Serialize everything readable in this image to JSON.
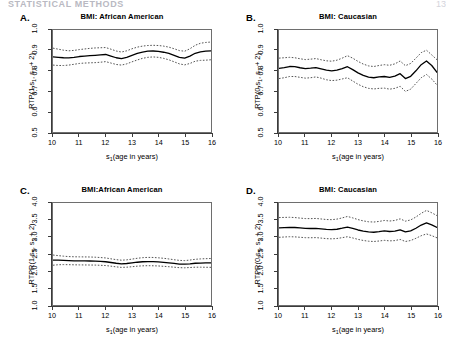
{
  "page": {
    "running_head": "STATISTICAL METHODS",
    "page_number": "13"
  },
  "figure": {
    "x_axis_title": "s1(age in years)",
    "x_ticks": [
      "10",
      "11",
      "12",
      "13",
      "14",
      "15",
      "16"
    ],
    "line_colors": {
      "estimate": "#000000",
      "confidence_band": "#555555",
      "axis": "#3b3b3b",
      "box": "#6e6e6e"
    }
  },
  "chart_data": [
    {
      "id": "A",
      "type": "line",
      "panel_letter": "A.",
      "title": "BMI: African American",
      "xlabel": "s1(age in years)",
      "ylabel": "RTP(1,s1, s1 + 2)",
      "ylabel_prefix": "RTP(1,s",
      "ylabel_suffix": ", s",
      "ylabel_tail": " + 2)",
      "xlim": [
        10,
        16
      ],
      "ylim": [
        0.5,
        1.0
      ],
      "y_ticks": [
        "0.5",
        "0.6",
        "0.7",
        "0.8",
        "0.9",
        "1.0"
      ],
      "grid": false,
      "legend": "none",
      "x": [
        10.0,
        10.2,
        10.4,
        10.6,
        10.8,
        11.0,
        11.2,
        11.4,
        11.6,
        11.8,
        12.0,
        12.2,
        12.4,
        12.6,
        12.8,
        13.0,
        13.2,
        13.4,
        13.6,
        13.8,
        14.0,
        14.2,
        14.4,
        14.6,
        14.8,
        15.0,
        15.2,
        15.4,
        15.6,
        15.8,
        16.0
      ],
      "series": [
        {
          "name": "estimate",
          "style": "solid",
          "values": [
            0.868,
            0.866,
            0.864,
            0.863,
            0.866,
            0.87,
            0.872,
            0.874,
            0.876,
            0.878,
            0.88,
            0.872,
            0.864,
            0.86,
            0.866,
            0.876,
            0.885,
            0.892,
            0.896,
            0.897,
            0.895,
            0.891,
            0.885,
            0.876,
            0.866,
            0.862,
            0.872,
            0.886,
            0.893,
            0.896,
            0.898
          ]
        },
        {
          "name": "upper confidence band",
          "style": "dotted",
          "values": [
            0.911,
            0.906,
            0.901,
            0.898,
            0.9,
            0.904,
            0.907,
            0.91,
            0.912,
            0.913,
            0.914,
            0.906,
            0.897,
            0.892,
            0.898,
            0.908,
            0.916,
            0.921,
            0.924,
            0.925,
            0.924,
            0.921,
            0.916,
            0.908,
            0.899,
            0.896,
            0.908,
            0.925,
            0.935,
            0.939,
            0.941
          ]
        },
        {
          "name": "lower confidence band",
          "style": "dotted",
          "values": [
            0.828,
            0.826,
            0.826,
            0.828,
            0.832,
            0.836,
            0.838,
            0.839,
            0.84,
            0.842,
            0.845,
            0.838,
            0.831,
            0.828,
            0.834,
            0.844,
            0.853,
            0.861,
            0.866,
            0.868,
            0.866,
            0.861,
            0.854,
            0.844,
            0.834,
            0.829,
            0.836,
            0.847,
            0.851,
            0.852,
            0.854
          ]
        }
      ]
    },
    {
      "id": "B",
      "type": "line",
      "panel_letter": "B.",
      "title": "BMI: Caucasian",
      "xlabel": "s1(age in years)",
      "ylabel": "RTP(0,s1, s1 + 2)",
      "ylabel_prefix": "RTP(0,s",
      "ylabel_suffix": ", s",
      "ylabel_tail": " + 2)",
      "xlim": [
        10,
        16
      ],
      "ylim": [
        0.5,
        1.0
      ],
      "y_ticks": [
        "0.5",
        "0.6",
        "0.7",
        "0.8",
        "0.9",
        "1.0"
      ],
      "grid": false,
      "legend": "none",
      "x": [
        10.0,
        10.2,
        10.4,
        10.6,
        10.8,
        11.0,
        11.2,
        11.4,
        11.6,
        11.8,
        12.0,
        12.2,
        12.4,
        12.6,
        12.8,
        13.0,
        13.2,
        13.4,
        13.6,
        13.8,
        14.0,
        14.2,
        14.4,
        14.6,
        14.8,
        15.0,
        15.2,
        15.4,
        15.6,
        15.8,
        16.0
      ],
      "series": [
        {
          "name": "estimate",
          "style": "solid",
          "values": [
            0.812,
            0.816,
            0.821,
            0.82,
            0.815,
            0.811,
            0.813,
            0.816,
            0.81,
            0.803,
            0.8,
            0.803,
            0.811,
            0.82,
            0.806,
            0.79,
            0.778,
            0.769,
            0.766,
            0.77,
            0.772,
            0.768,
            0.774,
            0.786,
            0.762,
            0.773,
            0.8,
            0.83,
            0.848,
            0.826,
            0.792
          ]
        },
        {
          "name": "upper confidence band",
          "style": "dotted",
          "values": [
            0.862,
            0.864,
            0.866,
            0.864,
            0.859,
            0.855,
            0.857,
            0.86,
            0.854,
            0.849,
            0.847,
            0.852,
            0.862,
            0.874,
            0.862,
            0.846,
            0.833,
            0.824,
            0.821,
            0.826,
            0.83,
            0.827,
            0.834,
            0.848,
            0.825,
            0.836,
            0.862,
            0.889,
            0.901,
            0.878,
            0.854
          ]
        },
        {
          "name": "lower confidence band",
          "style": "dotted",
          "values": [
            0.762,
            0.766,
            0.772,
            0.772,
            0.768,
            0.764,
            0.766,
            0.77,
            0.764,
            0.756,
            0.752,
            0.754,
            0.76,
            0.766,
            0.75,
            0.734,
            0.722,
            0.714,
            0.711,
            0.714,
            0.715,
            0.71,
            0.714,
            0.724,
            0.699,
            0.71,
            0.738,
            0.766,
            0.782,
            0.76,
            0.73
          ]
        }
      ]
    },
    {
      "id": "C",
      "type": "line",
      "panel_letter": "C.",
      "title": "BMI:African American",
      "xlabel": "s1(age in years)",
      "ylabel": "RTPR(1,s1, s1 + 2)",
      "ylabel_prefix": "RTPR(1,s",
      "ylabel_suffix": ", s",
      "ylabel_tail": " + 2)",
      "xlim": [
        10,
        16
      ],
      "ylim": [
        1.0,
        4.0
      ],
      "y_ticks": [
        "1.0",
        "1.5",
        "2.0",
        "2.5",
        "3.0",
        "3.5",
        "4.0"
      ],
      "grid": false,
      "legend": "none",
      "x": [
        10.0,
        10.2,
        10.4,
        10.6,
        10.8,
        11.0,
        11.2,
        11.4,
        11.6,
        11.8,
        12.0,
        12.2,
        12.4,
        12.6,
        12.8,
        13.0,
        13.2,
        13.4,
        13.6,
        13.8,
        14.0,
        14.2,
        14.4,
        14.6,
        14.8,
        15.0,
        15.2,
        15.4,
        15.6,
        15.8,
        16.0
      ],
      "series": [
        {
          "name": "estimate",
          "style": "solid",
          "values": [
            2.32,
            2.318,
            2.312,
            2.305,
            2.3,
            2.298,
            2.296,
            2.294,
            2.29,
            2.282,
            2.272,
            2.25,
            2.228,
            2.212,
            2.22,
            2.238,
            2.258,
            2.272,
            2.278,
            2.276,
            2.268,
            2.256,
            2.24,
            2.222,
            2.205,
            2.2,
            2.212,
            2.228,
            2.234,
            2.236,
            2.238
          ]
        },
        {
          "name": "upper confidence band",
          "style": "dotted",
          "values": [
            2.47,
            2.452,
            2.436,
            2.424,
            2.418,
            2.416,
            2.414,
            2.412,
            2.406,
            2.396,
            2.384,
            2.358,
            2.334,
            2.318,
            2.328,
            2.35,
            2.374,
            2.392,
            2.4,
            2.398,
            2.388,
            2.374,
            2.354,
            2.332,
            2.312,
            2.306,
            2.322,
            2.344,
            2.356,
            2.362,
            2.368
          ]
        },
        {
          "name": "lower confidence band",
          "style": "dotted",
          "values": [
            2.17,
            2.184,
            2.188,
            2.186,
            2.182,
            2.18,
            2.178,
            2.176,
            2.174,
            2.168,
            2.16,
            2.142,
            2.122,
            2.106,
            2.112,
            2.126,
            2.142,
            2.152,
            2.156,
            2.154,
            2.148,
            2.138,
            2.126,
            2.112,
            2.098,
            2.094,
            2.102,
            2.112,
            2.112,
            2.11,
            2.108
          ]
        }
      ]
    },
    {
      "id": "D",
      "type": "line",
      "panel_letter": "D.",
      "title": "BMI: Caucasian",
      "xlabel": "s1(age in years)",
      "ylabel": "RTPR(0,s1, s1 + 2)",
      "ylabel_prefix": "RTPR(0,s",
      "ylabel_suffix": ", s",
      "ylabel_tail": " + 2)",
      "xlim": [
        10,
        16
      ],
      "ylim": [
        1.0,
        4.0
      ],
      "y_ticks": [
        "1.0",
        "1.5",
        "2.0",
        "2.5",
        "3.0",
        "3.5",
        "4.0"
      ],
      "grid": false,
      "legend": "none",
      "x": [
        10.0,
        10.2,
        10.4,
        10.6,
        10.8,
        11.0,
        11.2,
        11.4,
        11.6,
        11.8,
        12.0,
        12.2,
        12.4,
        12.6,
        12.8,
        13.0,
        13.2,
        13.4,
        13.6,
        13.8,
        14.0,
        14.2,
        14.4,
        14.6,
        14.8,
        15.0,
        15.2,
        15.4,
        15.6,
        15.8,
        16.0
      ],
      "series": [
        {
          "name": "estimate",
          "style": "solid",
          "values": [
            3.27,
            3.278,
            3.285,
            3.28,
            3.266,
            3.252,
            3.25,
            3.254,
            3.238,
            3.222,
            3.216,
            3.228,
            3.258,
            3.292,
            3.252,
            3.206,
            3.172,
            3.148,
            3.14,
            3.156,
            3.18,
            3.162,
            3.172,
            3.212,
            3.148,
            3.18,
            3.258,
            3.352,
            3.418,
            3.358,
            3.282
          ]
        },
        {
          "name": "upper confidence band",
          "style": "dotted",
          "values": [
            3.572,
            3.576,
            3.58,
            3.572,
            3.556,
            3.542,
            3.54,
            3.546,
            3.53,
            3.514,
            3.51,
            3.526,
            3.562,
            3.604,
            3.562,
            3.512,
            3.474,
            3.448,
            3.44,
            3.458,
            3.486,
            3.47,
            3.486,
            3.534,
            3.466,
            3.502,
            3.588,
            3.696,
            3.782,
            3.712,
            3.628
          ]
        },
        {
          "name": "lower confidence band",
          "style": "dotted",
          "values": [
            2.99,
            3.0,
            3.008,
            3.004,
            2.992,
            2.98,
            2.978,
            2.982,
            2.968,
            2.952,
            2.946,
            2.956,
            2.98,
            3.008,
            2.972,
            2.93,
            2.898,
            2.876,
            2.868,
            2.882,
            2.902,
            2.886,
            2.894,
            2.928,
            2.868,
            2.896,
            2.962,
            3.038,
            3.09,
            3.04,
            2.976
          ]
        }
      ]
    }
  ]
}
